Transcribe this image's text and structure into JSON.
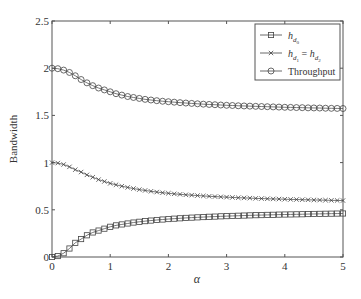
{
  "chart_data": {
    "type": "line",
    "title": "",
    "xlabel": "α",
    "ylabel": "Bandwidth",
    "xlim": [
      0,
      5
    ],
    "ylim": [
      0,
      2.5
    ],
    "xticks": [
      "0",
      "1",
      "2",
      "3",
      "4",
      "5"
    ],
    "yticks": [
      "0",
      "0.5",
      "1",
      "1.5",
      "2",
      "2.5"
    ],
    "grid": false,
    "legend_position": "upper right",
    "x": [
      0,
      0.1,
      0.2,
      0.3,
      0.4,
      0.5,
      0.6,
      0.7,
      0.8,
      0.9,
      1.0,
      1.1,
      1.2,
      1.3,
      1.4,
      1.5,
      1.6,
      1.7,
      1.8,
      1.9,
      2.0,
      2.1,
      2.2,
      2.3,
      2.4,
      2.5,
      2.6,
      2.7,
      2.8,
      2.9,
      3.0,
      3.1,
      3.2,
      3.3,
      3.4,
      3.5,
      3.6,
      3.7,
      3.8,
      3.9,
      4.0,
      4.1,
      4.2,
      4.3,
      4.4,
      4.5,
      4.6,
      4.7,
      4.8,
      4.9,
      5.0
    ],
    "series": [
      {
        "name": "h_d0",
        "label_main": "h",
        "label_sub": "d",
        "label_subsub": "0",
        "marker": "square",
        "values": [
          0.0,
          0.01,
          0.04,
          0.09,
          0.15,
          0.19,
          0.23,
          0.26,
          0.28,
          0.3,
          0.32,
          0.335,
          0.345,
          0.355,
          0.365,
          0.373,
          0.38,
          0.386,
          0.392,
          0.397,
          0.402,
          0.406,
          0.41,
          0.414,
          0.417,
          0.42,
          0.423,
          0.426,
          0.428,
          0.431,
          0.433,
          0.435,
          0.437,
          0.439,
          0.441,
          0.443,
          0.444,
          0.446,
          0.447,
          0.449,
          0.45,
          0.451,
          0.452,
          0.453,
          0.455,
          0.456,
          0.457,
          0.458,
          0.459,
          0.46,
          0.461
        ]
      },
      {
        "name": "h_d1 = h_d2",
        "marker": "x",
        "values": [
          1.0,
          0.995,
          0.98,
          0.955,
          0.925,
          0.9,
          0.87,
          0.845,
          0.82,
          0.8,
          0.78,
          0.765,
          0.75,
          0.737,
          0.725,
          0.714,
          0.705,
          0.696,
          0.688,
          0.681,
          0.675,
          0.669,
          0.664,
          0.659,
          0.655,
          0.651,
          0.647,
          0.643,
          0.64,
          0.637,
          0.634,
          0.631,
          0.628,
          0.626,
          0.624,
          0.621,
          0.619,
          0.617,
          0.615,
          0.614,
          0.612,
          0.61,
          0.609,
          0.607,
          0.606,
          0.604,
          0.603,
          0.602,
          0.6,
          0.599,
          0.598
        ]
      },
      {
        "name": "Throughput",
        "marker": "circle",
        "values": [
          2.0,
          1.995,
          1.98,
          1.955,
          1.92,
          1.88,
          1.845,
          1.815,
          1.79,
          1.77,
          1.75,
          1.73,
          1.715,
          1.7,
          1.69,
          1.68,
          1.67,
          1.663,
          1.656,
          1.65,
          1.645,
          1.64,
          1.635,
          1.631,
          1.627,
          1.623,
          1.619,
          1.616,
          1.613,
          1.61,
          1.607,
          1.605,
          1.602,
          1.6,
          1.598,
          1.596,
          1.594,
          1.592,
          1.59,
          1.588,
          1.586,
          1.585,
          1.583,
          1.582,
          1.58,
          1.579,
          1.578,
          1.576,
          1.575,
          1.574,
          1.573
        ]
      }
    ]
  },
  "legend": {
    "items": [
      {
        "main": "h",
        "sub": "d",
        "subsub": "0",
        "marker": "square"
      },
      {
        "main": "h",
        "sub": "d",
        "subsub": "1",
        "eq": "=",
        "main2": "h",
        "sub2": "d",
        "subsub2": "2",
        "marker": "x"
      },
      {
        "text": "Throughput",
        "marker": "circle"
      }
    ]
  }
}
